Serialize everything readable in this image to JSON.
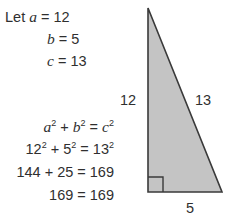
{
  "figure": {
    "background_color": "#ffffff",
    "text_color": "#2f2f2f",
    "triangle": {
      "fill_color": "#c4c4c4",
      "stroke_color": "#3a3a3a",
      "right_angle_marker": "right-angle-square",
      "vertices_px": [
        [
          33,
          8
        ],
        [
          33,
          192
        ],
        [
          107,
          192
        ]
      ]
    }
  },
  "givens": {
    "line1_prefix": "Let ",
    "line1_var": "a",
    "line1_rest": " = 12",
    "line2_var": "b",
    "line2_rest": " = 5",
    "line3_var": "c",
    "line3_rest": " = 13"
  },
  "equations": {
    "line1": {
      "v1": "a",
      "p1": "2",
      "op1": " + ",
      "v2": "b",
      "p2": "2",
      "op2": " = ",
      "v3": "c",
      "p3": "2"
    },
    "line2": {
      "v1": "12",
      "p1": "2",
      "op1": " + ",
      "v2": "5",
      "p2": "2",
      "op2": " = ",
      "v3": "13",
      "p3": "2"
    },
    "line3": "144 + 25 = 169",
    "line4": "169 = 169"
  },
  "side_labels": {
    "vertical_leg": "12",
    "hypotenuse": "13",
    "base": "5"
  }
}
